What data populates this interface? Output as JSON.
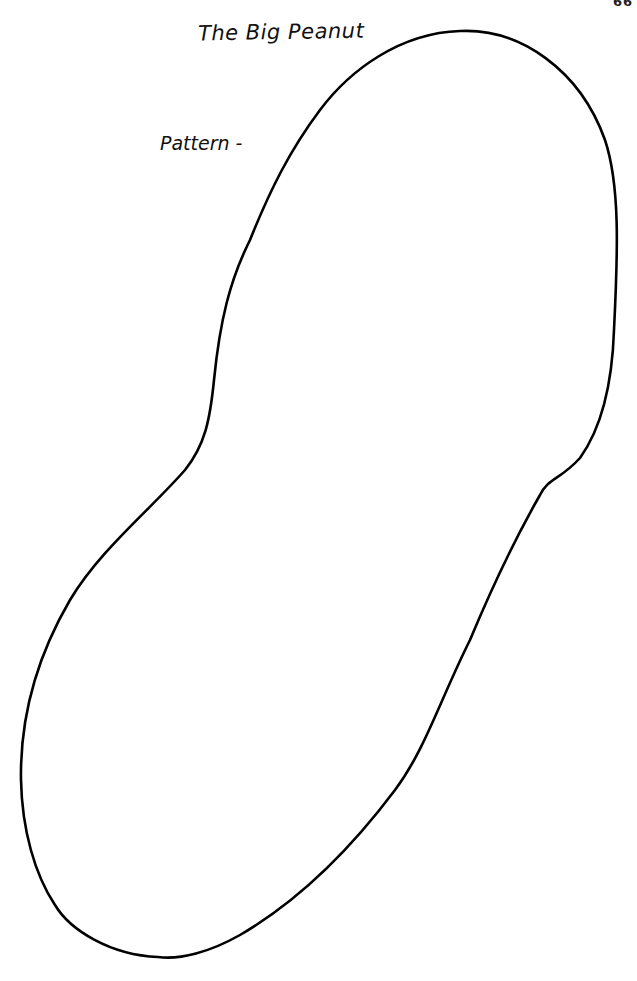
{
  "page": {
    "page_number": "66",
    "title": "The Big Peanut",
    "pattern_label": "Pattern -",
    "shape": {
      "name": "peanut-outline",
      "stroke_color": "#000000",
      "fill_color": "#ffffff"
    }
  }
}
